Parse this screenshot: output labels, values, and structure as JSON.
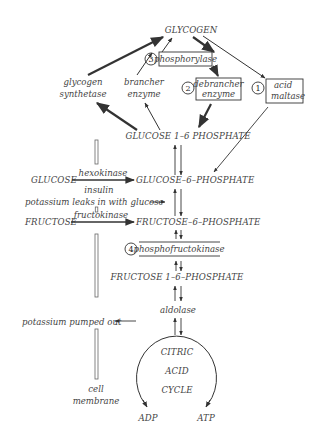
{
  "diagram": {
    "type": "metabolic-pathway",
    "nodes": {
      "glycogen": "GLYCOGEN",
      "glucose_1_6": "GLUCOSE 1–6 PHOSPHATE",
      "glucose": "GLUCOSE",
      "glucose_6": "GLUCOSE–6–PHOSPHATE",
      "fructose": "FRUCTOSE",
      "fructose_6": "FRUCTOSE–6–PHOSPHATE",
      "fructose_1_6": "FRUCTOSE 1–6–PHOSPHATE",
      "citric_1": "CITRIC",
      "citric_2": "ACID",
      "citric_3": "CYCLE",
      "adp": "ADP",
      "atp": "ATP"
    },
    "enzymes": {
      "glycogen_synthetase_1": "glycogen",
      "glycogen_synthetase_2": "synthetase",
      "brancher_1": "brancher",
      "brancher_2": "enzyme",
      "phosphorylase": "phosphorylase",
      "debrancher_1": "debrancher",
      "debrancher_2": "enzyme",
      "acid_maltase_1": "acid",
      "acid_maltase_2": "maltase",
      "hexokinase": "hexokinase",
      "insulin": "insulin",
      "fructokinase": "fructokinase",
      "phosphofructokinase": "phosphofructokinase",
      "aldolase": "aldolase"
    },
    "numbers": {
      "n1": "1",
      "n2": "2",
      "n3": "3",
      "n4": "4"
    },
    "notes": {
      "potassium_leaks": "potassium leaks in with glucose",
      "potassium_pumped": "potassium pumped out",
      "cell_1": "cell",
      "cell_2": "membrane"
    },
    "colors": {
      "ink": "#333333",
      "text": "#444444",
      "membrane": "#666666",
      "background": "#ffffff"
    }
  }
}
